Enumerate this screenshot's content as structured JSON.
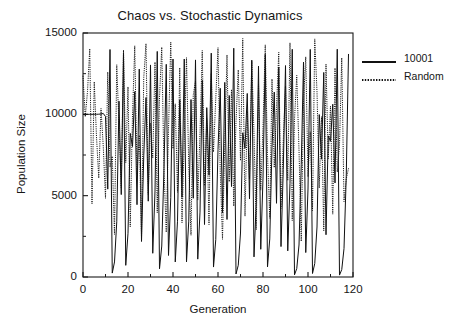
{
  "chart_data": {
    "type": "line",
    "title": "Chaos vs. Stochastic Dynamics",
    "xlabel": "Generation",
    "ylabel": "Population Size",
    "xlim": [
      0,
      120
    ],
    "ylim": [
      0,
      15000
    ],
    "grid": false,
    "legend_position": "right-outside",
    "x_ticks": [
      "0",
      "20",
      "40",
      "60",
      "80",
      "100",
      "120"
    ],
    "x_tick_values": [
      0,
      20,
      40,
      60,
      80,
      100,
      120
    ],
    "x_minor_step": 10,
    "y_ticks": [
      "0",
      "5000",
      "10000",
      "15000"
    ],
    "y_tick_values": [
      0,
      5000,
      10000,
      15000
    ],
    "y_minor_step": 2500,
    "series": [
      {
        "name": "10001",
        "style": "solid",
        "color": "#111111",
        "values": [
          10001,
          10001,
          10001,
          10001,
          10001,
          10002,
          10004,
          10009,
          10022,
          10055,
          9865,
          5402,
          13985,
          241,
          925,
          3396,
          10808,
          5066,
          13790,
          717,
          2690,
          8830,
          8019,
          11396,
          4445,
          12784,
          2184,
          7453,
          11032,
          4661,
          13036,
          1459,
          5284,
          13868,
          505,
          1904,
          6713,
          13075,
          1324,
          4876,
          13401,
          926,
          3427,
          10887,
          4898,
          13400,
          928,
          3434,
          10908,
          4838,
          13345,
          1098,
          3989,
          12090,
          3226,
          10411,
          6266,
          13761,
          611,
          2295,
          7831,
          11601,
          3935,
          11965,
          3536,
          11157,
          5561,
          14065,
          186,
          721,
          2703,
          8866,
          7910,
          11283,
          4796,
          13300,
          1237,
          4571,
          12963,
          1704,
          6084,
          13689,
          623,
          2339,
          7960,
          11370,
          4531,
          12912,
          1870,
          6598,
          12998,
          1607,
          5757,
          13999,
          133,
          518,
          1967,
          6910,
          13212,
          1503,
          5410,
          13991,
          216,
          832,
          3074,
          9985,
          7244,
          12575,
          2598,
          8676,
          8344,
          10618,
          5780,
          14003,
          117,
          458,
          1748,
          6215,
          13710
        ]
      },
      {
        "name": "Random",
        "style": "dotted",
        "color": "#111111",
        "values": [
          12371,
          9847,
          11406,
          14036,
          4496,
          12004,
          8617,
          6079,
          10358,
          8041,
          4841,
          12598,
          6753,
          7421,
          2623,
          13046,
          9310,
          5486,
          13955,
          7033,
          11688,
          3085,
          9927,
          14209,
          6302,
          8714,
          2486,
          12260,
          14345,
          5075,
          9448,
          7316,
          13213,
          3952,
          11033,
          14130,
          6595,
          2755,
          9016,
          14443,
          7894,
          10647,
          5209,
          12865,
          3338,
          8483,
          13480,
          6871,
          2567,
          11187,
          12047,
          4730,
          8869,
          13922,
          5614,
          9725,
          3227,
          12516,
          7685,
          10935,
          14096,
          6440,
          2318,
          8206,
          13648,
          5852,
          11526,
          4358,
          9564,
          12733,
          7158,
          14660,
          3745,
          10184,
          6015,
          13355,
          8790,
          2907,
          11852,
          5340,
          9193,
          14269,
          7540,
          3610,
          12172,
          6728,
          10420,
          13814,
          4214,
          8358,
          11741,
          5933,
          14397,
          3477,
          9671,
          12392,
          7807,
          2196,
          10772,
          13534,
          6166,
          8925,
          4085,
          14637,
          11380,
          5476,
          9859,
          2840,
          13090,
          7267,
          10506,
          3864,
          12847,
          6457,
          8106,
          13473,
          4640,
          6012,
          6679
        ]
      }
    ]
  },
  "axes": {
    "title": "Chaos vs. Stochastic Dynamics",
    "x_axis_label": "Generation",
    "y_axis_label": "Population Size"
  },
  "legend": {
    "entries": [
      {
        "label": "10001",
        "style": "solid"
      },
      {
        "label": "Random",
        "style": "dotted"
      }
    ]
  }
}
